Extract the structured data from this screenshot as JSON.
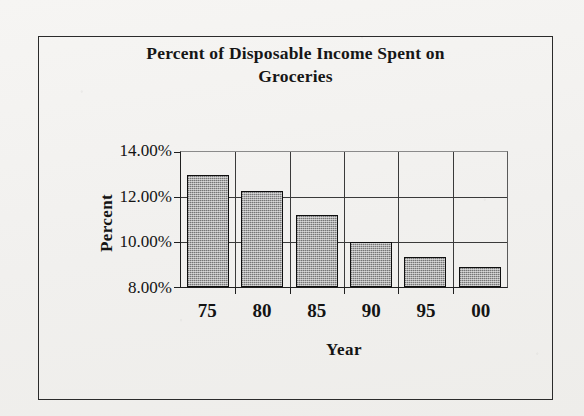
{
  "chart_data": {
    "type": "bar",
    "title": "Percent of Disposable Income Spent on Groceries",
    "title_line1": "Percent of Disposable Income Spent on",
    "title_line2": "Groceries",
    "xlabel": "Year",
    "ylabel": "Percent",
    "categories": [
      "75",
      "80",
      "85",
      "90",
      "95",
      "00"
    ],
    "values": [
      13.0,
      12.25,
      11.2,
      10.0,
      9.35,
      8.9
    ],
    "ylim": [
      8.0,
      14.0
    ],
    "yticks": [
      8.0,
      10.0,
      12.0,
      14.0
    ],
    "ytick_labels": [
      "8.00%",
      "10.00%",
      "12.00%",
      "14.00%"
    ],
    "grid": true,
    "grid_axis": "both",
    "legend": false,
    "legend_position": "none",
    "bar_fill_color": "#a9a9a9",
    "bar_edge_color": "#0f0f0f",
    "background_color": "#f4f3f1",
    "axis_color": "#1f1f1f",
    "series": [
      {
        "name": "Percent of Disposable Income Spent on Groceries",
        "values": [
          13.0,
          12.25,
          11.2,
          10.0,
          9.35,
          8.9
        ]
      }
    ],
    "points": [
      {
        "year": "75",
        "percent": 13.0,
        "label": "13.00%"
      },
      {
        "year": "80",
        "percent": 12.25,
        "label": "12.25%"
      },
      {
        "year": "85",
        "percent": 11.2,
        "label": "11.20%"
      },
      {
        "year": "90",
        "percent": 10.0,
        "label": "10.00%"
      },
      {
        "year": "95",
        "percent": 9.35,
        "label": "9.35%"
      },
      {
        "year": "00",
        "percent": 8.9,
        "label": "8.90%"
      }
    ]
  }
}
